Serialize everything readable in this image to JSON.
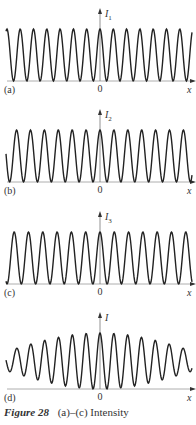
{
  "figure": {
    "panels": [
      {
        "id": "a",
        "label": "(a)",
        "ylabel": "I",
        "ysub": "1",
        "origin": "0",
        "xlabel": "x"
      },
      {
        "id": "b",
        "label": "(b)",
        "ylabel": "I",
        "ysub": "2",
        "origin": "0",
        "xlabel": "x"
      },
      {
        "id": "c",
        "label": "(c)",
        "ylabel": "I",
        "ysub": "3",
        "origin": "0",
        "xlabel": "x"
      },
      {
        "id": "d",
        "label": "(d)",
        "ylabel": "I",
        "ysub": "",
        "origin": "0",
        "xlabel": "x"
      }
    ],
    "caption_number": "Figure 28",
    "caption_text": "(a)–(c) Intensity"
  },
  "chart_data": [
    {
      "type": "line",
      "title": "(a)",
      "ylabel": "I1",
      "xlabel": "x",
      "description": "cos² fringes, constant amplitude, max at x=0",
      "fringe_period_px": 13.3,
      "amplitude": 1.0,
      "phase": 0
    },
    {
      "type": "line",
      "title": "(b)",
      "ylabel": "I2",
      "xlabel": "x",
      "description": "cos² fringes, constant amplitude, slightly different period",
      "fringe_period_px": 13.8,
      "amplitude": 1.0,
      "phase": 0
    },
    {
      "type": "line",
      "title": "(c)",
      "ylabel": "I3",
      "xlabel": "x",
      "description": "cos² fringes, constant amplitude, slightly different period",
      "fringe_period_px": 14.3,
      "amplitude": 1.0,
      "phase": 0
    },
    {
      "type": "line",
      "title": "(d)",
      "ylabel": "I",
      "xlabel": "x",
      "description": "sum I1+I2+I3: fringes with decreasing visibility away from x=0",
      "fringe_period_px": 13.8,
      "envelope": "decreasing"
    }
  ]
}
